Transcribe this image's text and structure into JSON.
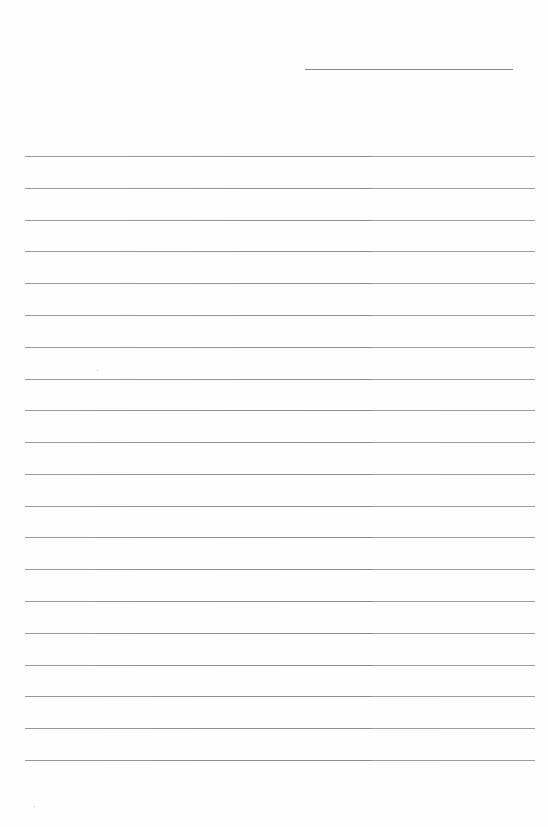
{
  "page": {
    "type": "lined-paper",
    "header_line": {
      "visible": true
    },
    "ruled_lines": {
      "count": 20
    },
    "text_content": []
  },
  "colors": {
    "background": "#fefefe",
    "line": "#8c8c8c"
  }
}
